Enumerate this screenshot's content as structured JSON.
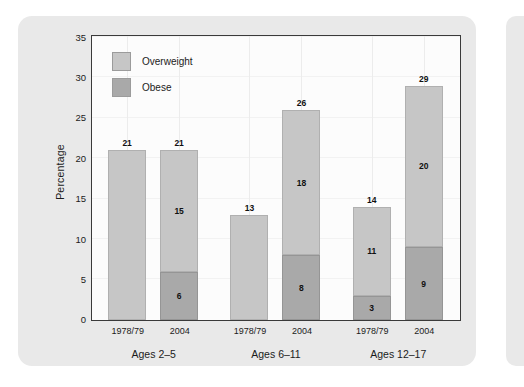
{
  "chart_data": {
    "type": "bar",
    "subtype": "stacked-grouped",
    "title": "",
    "xlabel": "",
    "ylabel": "Percentage",
    "ylim": [
      0,
      35
    ],
    "ytick_values": [
      0,
      5,
      10,
      15,
      20,
      25,
      30,
      35
    ],
    "ytick_labels": [
      "0",
      "5",
      "10",
      "15",
      "20",
      "25",
      "30",
      "35"
    ],
    "grid": true,
    "legend_position": "top-left",
    "legend": [
      {
        "label": "Overweight",
        "color": "#c6c6c6"
      },
      {
        "label": "Obese",
        "color": "#a9a9a9"
      }
    ],
    "series": [
      {
        "name": "Overweight",
        "color": "#c6c6c6",
        "values": [
          21,
          15,
          13,
          18,
          11,
          20
        ]
      },
      {
        "name": "Obese",
        "color": "#a9a9a9",
        "values": [
          0,
          6,
          0,
          8,
          3,
          9
        ]
      }
    ],
    "categories": [
      "1978/79",
      "2004",
      "1978/79",
      "2004",
      "1978/79",
      "2004"
    ],
    "totals": [
      21,
      21,
      13,
      26,
      14,
      29
    ],
    "groups": [
      {
        "label": "Ages 2–5",
        "bars": [
          {
            "x_label": "1978/79",
            "total": 21,
            "overweight": 21,
            "obese": 0,
            "overweight_label": "",
            "obese_label": "",
            "total_label": "21"
          },
          {
            "x_label": "2004",
            "total": 21,
            "overweight": 15,
            "obese": 6,
            "overweight_label": "15",
            "obese_label": "6",
            "total_label": "21"
          }
        ]
      },
      {
        "label": "Ages 6–11",
        "bars": [
          {
            "x_label": "1978/79",
            "total": 13,
            "overweight": 13,
            "obese": 0,
            "overweight_label": "",
            "obese_label": "",
            "total_label": "13"
          },
          {
            "x_label": "2004",
            "total": 26,
            "overweight": 18,
            "obese": 8,
            "overweight_label": "18",
            "obese_label": "8",
            "total_label": "26"
          }
        ]
      },
      {
        "label": "Ages 12–17",
        "bars": [
          {
            "x_label": "1978/79",
            "total": 14,
            "overweight": 11,
            "obese": 3,
            "overweight_label": "11",
            "obese_label": "3",
            "total_label": "14"
          },
          {
            "x_label": "2004",
            "total": 29,
            "overweight": 20,
            "obese": 9,
            "overweight_label": "20",
            "obese_label": "9",
            "total_label": "29"
          }
        ]
      }
    ]
  },
  "colors": {
    "panel_background": "#e9e9e9",
    "plot_background": "#fcfcfc",
    "axis": "#3a3a3a",
    "overweight": "#c6c6c6",
    "obese": "#a9a9a9",
    "text": "#1b1b1b"
  }
}
